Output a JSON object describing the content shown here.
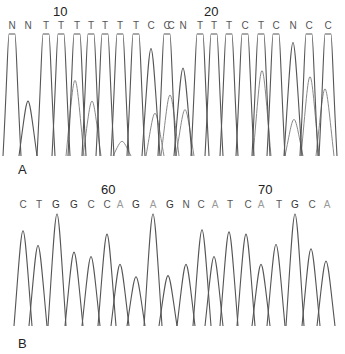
{
  "chart_data": [
    {
      "type": "line",
      "title": "DNA sequencing chromatogram A",
      "panel_label": "A",
      "position_markers": [
        {
          "label": "10",
          "x": 60
        },
        {
          "label": "20",
          "x": 212
        }
      ],
      "bases": [
        {
          "base": "N",
          "x": 12,
          "color": "#555555"
        },
        {
          "base": "N",
          "x": 28,
          "color": "#555555"
        },
        {
          "base": "T",
          "x": 46,
          "color": "#555555"
        },
        {
          "base": "T",
          "x": 61,
          "color": "#555555"
        },
        {
          "base": "T",
          "x": 77,
          "color": "#555555"
        },
        {
          "base": "T",
          "x": 91,
          "color": "#555555"
        },
        {
          "base": "T",
          "x": 105,
          "color": "#555555"
        },
        {
          "base": "T",
          "x": 120,
          "color": "#555555"
        },
        {
          "base": "T",
          "x": 136,
          "color": "#555555"
        },
        {
          "base": "C",
          "x": 151,
          "color": "#555555"
        },
        {
          "base": "C",
          "x": 167,
          "color": "#555555"
        },
        {
          "base": "C",
          "x": 171,
          "color": "#555555"
        },
        {
          "base": "N",
          "x": 183,
          "color": "#555555"
        },
        {
          "base": "T",
          "x": 200,
          "color": "#555555"
        },
        {
          "base": "T",
          "x": 214,
          "color": "#555555"
        },
        {
          "base": "T",
          "x": 229,
          "color": "#555555"
        },
        {
          "base": "C",
          "x": 245,
          "color": "#555555"
        },
        {
          "base": "T",
          "x": 261,
          "color": "#555555"
        },
        {
          "base": "C",
          "x": 276,
          "color": "#555555"
        },
        {
          "base": "N",
          "x": 293,
          "color": "#555555"
        },
        {
          "base": "C",
          "x": 309,
          "color": "#555555"
        },
        {
          "base": "C",
          "x": 328,
          "color": "#555555"
        }
      ],
      "sequence": "NNTTTTTTTCCCNTTTCTCNCC",
      "peaks": [
        {
          "x": 12,
          "h": 1.0
        },
        {
          "x": 28,
          "h": 0.45
        },
        {
          "x": 46,
          "h": 1.0
        },
        {
          "x": 61,
          "h": 1.0
        },
        {
          "x": 77,
          "h": 1.0
        },
        {
          "x": 91,
          "h": 1.0
        },
        {
          "x": 105,
          "h": 1.0
        },
        {
          "x": 120,
          "h": 1.0
        },
        {
          "x": 136,
          "h": 1.0
        },
        {
          "x": 151,
          "h": 0.88
        },
        {
          "x": 167,
          "h": 1.0
        },
        {
          "x": 183,
          "h": 0.72
        },
        {
          "x": 200,
          "h": 1.0
        },
        {
          "x": 214,
          "h": 1.0
        },
        {
          "x": 229,
          "h": 1.0
        },
        {
          "x": 245,
          "h": 1.0
        },
        {
          "x": 261,
          "h": 1.0
        },
        {
          "x": 276,
          "h": 1.0
        },
        {
          "x": 293,
          "h": 0.93
        },
        {
          "x": 309,
          "h": 1.0
        },
        {
          "x": 328,
          "h": 1.0
        }
      ],
      "secondary_peaks": [
        {
          "x": 75,
          "h": 0.62
        },
        {
          "x": 92,
          "h": 0.45
        },
        {
          "x": 122,
          "h": 0.12
        },
        {
          "x": 155,
          "h": 0.35
        },
        {
          "x": 170,
          "h": 0.5
        },
        {
          "x": 185,
          "h": 0.38
        },
        {
          "x": 262,
          "h": 0.7
        },
        {
          "x": 294,
          "h": 0.3
        },
        {
          "x": 310,
          "h": 0.65
        },
        {
          "x": 325,
          "h": 0.55
        }
      ],
      "xlabel": "",
      "ylabel": "",
      "grid": false
    },
    {
      "type": "line",
      "title": "DNA sequencing chromatogram B",
      "panel_label": "B",
      "position_markers": [
        {
          "label": "60",
          "x": 110
        },
        {
          "label": "70",
          "x": 267
        }
      ],
      "bases": [
        {
          "base": "C",
          "x": 23,
          "color": "#555555"
        },
        {
          "base": "T",
          "x": 39,
          "color": "#555555"
        },
        {
          "base": "G",
          "x": 56,
          "color": "#333333"
        },
        {
          "base": "G",
          "x": 74,
          "color": "#333333"
        },
        {
          "base": "C",
          "x": 91,
          "color": "#555555"
        },
        {
          "base": "C",
          "x": 107,
          "color": "#555555"
        },
        {
          "base": "A",
          "x": 120,
          "color": "#999999"
        },
        {
          "base": "G",
          "x": 136,
          "color": "#333333"
        },
        {
          "base": "A",
          "x": 153,
          "color": "#999999"
        },
        {
          "base": "G",
          "x": 170,
          "color": "#333333"
        },
        {
          "base": "N",
          "x": 186,
          "color": "#555555"
        },
        {
          "base": "C",
          "x": 201,
          "color": "#555555"
        },
        {
          "base": "A",
          "x": 215,
          "color": "#999999"
        },
        {
          "base": "T",
          "x": 230,
          "color": "#555555"
        },
        {
          "base": "C",
          "x": 248,
          "color": "#555555"
        },
        {
          "base": "A",
          "x": 261,
          "color": "#999999"
        },
        {
          "base": "T",
          "x": 279,
          "color": "#555555"
        },
        {
          "base": "G",
          "x": 295,
          "color": "#333333"
        },
        {
          "base": "C",
          "x": 312,
          "color": "#555555"
        },
        {
          "base": "A",
          "x": 327,
          "color": "#999999"
        }
      ],
      "sequence": "CTGGCCAGAGNCATCATGCA",
      "peaks": [
        {
          "x": 23,
          "h": 0.85
        },
        {
          "x": 38,
          "h": 0.72
        },
        {
          "x": 57,
          "h": 1.0
        },
        {
          "x": 74,
          "h": 0.66
        },
        {
          "x": 91,
          "h": 0.62
        },
        {
          "x": 107,
          "h": 0.82
        },
        {
          "x": 120,
          "h": 0.55
        },
        {
          "x": 136,
          "h": 0.44
        },
        {
          "x": 153,
          "h": 1.0
        },
        {
          "x": 168,
          "h": 0.45
        },
        {
          "x": 186,
          "h": 0.55
        },
        {
          "x": 202,
          "h": 0.86
        },
        {
          "x": 214,
          "h": 0.62
        },
        {
          "x": 229,
          "h": 0.84
        },
        {
          "x": 246,
          "h": 0.82
        },
        {
          "x": 261,
          "h": 0.55
        },
        {
          "x": 276,
          "h": 0.73
        },
        {
          "x": 295,
          "h": 1.0
        },
        {
          "x": 311,
          "h": 0.69
        },
        {
          "x": 326,
          "h": 0.58
        }
      ],
      "xlabel": "",
      "ylabel": "",
      "grid": false
    }
  ]
}
